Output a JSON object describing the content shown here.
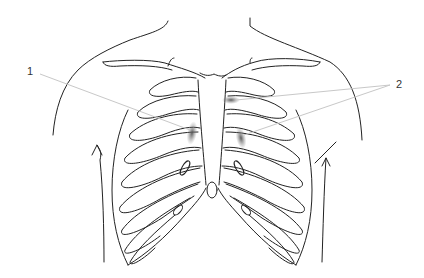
{
  "figure": {
    "labels": [
      {
        "id": "1",
        "text": "1",
        "x": 27,
        "y": 73
      },
      {
        "id": "2",
        "text": "2",
        "x": 398,
        "y": 85
      }
    ],
    "markers": [
      {
        "label": "1",
        "cx": 192,
        "cy": 133,
        "side": "left-parasternal"
      },
      {
        "label": "2",
        "cx": 231,
        "cy": 100,
        "side": "right-parasternal-upper"
      },
      {
        "label": "2",
        "cx": 241,
        "cy": 138,
        "side": "right-parasternal-lower"
      }
    ],
    "colors": {
      "line": "#222222",
      "leader": "#c8c8c8",
      "marker": "#666666",
      "label": "#333333"
    }
  }
}
